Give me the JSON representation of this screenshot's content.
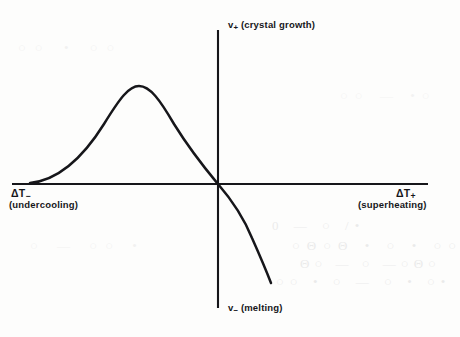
{
  "figure": {
    "background_color": "#fdfdfc",
    "ink_color": "#16161a",
    "labels": {
      "y_positive_symbol": "v",
      "y_positive_subscript": "+",
      "y_positive_text": "(crystal growth)",
      "y_negative_symbol": "v",
      "y_negative_subscript": "−",
      "y_negative_text": "(melting)",
      "x_negative_symbol": "ΔT",
      "x_negative_subscript": "−",
      "x_negative_text": "(undercooling)",
      "x_positive_symbol": "ΔT",
      "x_positive_subscript": "+",
      "x_positive_text": "(superheating)"
    },
    "bleed_through": {
      "line_1": "0 — ○  /•",
      "line_2": "○Θ○Θ  •  ○ • ○○",
      "line_3": "Θ○ — ○  —○Θ○",
      "line_4": "○○  • ○ — ○ • ○•",
      "line_5": "○○ • ○○",
      "line_6": "○ — ○○ •",
      "line_7": "○○ — •○"
    }
  },
  "chart_data": {
    "type": "line",
    "title": "",
    "subtitle": "",
    "xlabel": "ΔT (deviation from melting temperature)",
    "ylabel": "v (interface velocity)",
    "xlim": [
      -206,
      210
    ],
    "ylim": [
      -124,
      154
    ],
    "grid": false,
    "legend": false,
    "axes": {
      "origin_px": [
        218,
        184
      ],
      "x_axis_span_px": [
        12,
        428
      ],
      "y_axis_span_px": [
        30,
        308
      ],
      "x_axis_label_negative": "ΔT− (undercooling)",
      "x_axis_label_positive": "ΔT+ (superheating)",
      "y_axis_label_positive": "v+ (crystal growth)",
      "y_axis_label_negative": "v− (melting)",
      "ticks": [],
      "tick_labels": []
    },
    "annotations": [
      {
        "text": "peak crystal growth rate",
        "x": -80,
        "y": 98
      },
      {
        "text": "curve passes through origin",
        "x": 0,
        "y": 0
      }
    ],
    "series": [
      {
        "name": "interface velocity v(ΔT)",
        "description": "Crystal growth rate rises from zero at large undercooling, peaks, falls back through the origin, then becomes increasingly negative (melting) with superheating.",
        "x": [
          -188,
          -178,
          -168,
          -158,
          -148,
          -138,
          -128,
          -118,
          -108,
          -98,
          -88,
          -80,
          -72,
          -62,
          -52,
          -42,
          -32,
          -22,
          -12,
          0,
          10,
          20,
          30,
          40,
          50,
          53
        ],
        "y": [
          0,
          1,
          3,
          6,
          12,
          21,
          33,
          48,
          66,
          82,
          93,
          98,
          97,
          92,
          84,
          74,
          62,
          46,
          26,
          0,
          -14,
          -30,
          -49,
          -70,
          -92,
          -99
        ]
      }
    ],
    "curve_control_points_px": {
      "description": "Cubic Bezier control points in screenshot pixel coordinates used to draw the curve.",
      "start": [
        30,
        183
      ],
      "segments": [
        {
          "c1": [
            60,
            180
          ],
          "c2": [
            84,
            156
          ],
          "end": [
            104,
            124
          ]
        },
        {
          "c1": [
            120,
            98
          ],
          "c2": [
            129,
            86
          ],
          "end": [
            139,
            86
          ]
        },
        {
          "c1": [
            150,
            86
          ],
          "c2": [
            160,
            100
          ],
          "end": [
            174,
            124
          ]
        },
        {
          "c1": [
            192,
            153
          ],
          "c2": [
            208,
            172
          ],
          "end": [
            218,
            184
          ]
        },
        {
          "c1": [
            231,
            199
          ],
          "c2": [
            243,
            216
          ],
          "end": [
            252,
            238
          ]
        },
        {
          "c1": [
            260,
            256
          ],
          "c2": [
            266,
            270
          ],
          "end": [
            271,
            283
          ]
        }
      ]
    }
  }
}
